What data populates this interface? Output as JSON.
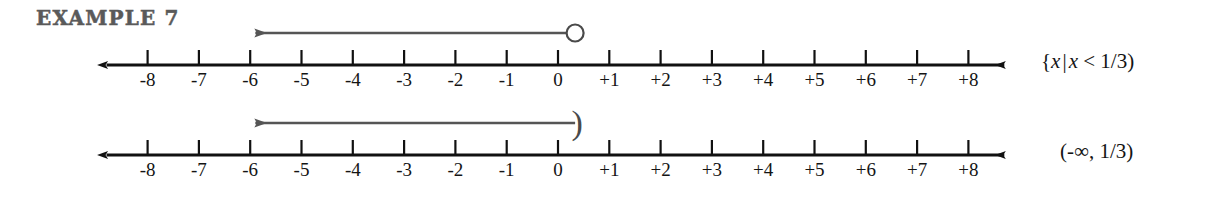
{
  "heading": {
    "label": "EXAMPLE 7"
  },
  "colors": {
    "axis": "#111111",
    "ray": "#555555",
    "marker": "#4a4a4a",
    "text": "#141414",
    "heading": "#5a5a5a",
    "background": "#ffffff"
  },
  "axis": {
    "tick_labels": [
      "-8",
      "-7",
      "-6",
      "-5",
      "-4",
      "-3",
      "-2",
      "-1",
      "0",
      "+1",
      "+2",
      "+3",
      "+4",
      "+5",
      "+6",
      "+7",
      "+8"
    ],
    "tick_values": [
      -8,
      -7,
      -6,
      -5,
      -4,
      -3,
      -2,
      -1,
      0,
      1,
      2,
      3,
      4,
      5,
      6,
      7,
      8
    ],
    "x_min": -8.8,
    "x_max": 8.7,
    "left_arrow": true,
    "right_arrow": true
  },
  "lines": [
    {
      "id": "set-builder-line",
      "notation": {
        "open_brace": "{",
        "var1": "x",
        "separator": "|",
        "var2": "x",
        "relation": "<",
        "value": "1/3",
        "close": ")",
        "full_text": "{x | x < 1/3)"
      },
      "ray": {
        "from_value": 0.3333,
        "to_value": -5.9,
        "direction": "left",
        "arrow_at": "left-end"
      },
      "endpoint": {
        "value": 0.3333,
        "type": "open-circle",
        "included": false,
        "label": "1/3"
      }
    },
    {
      "id": "interval-line",
      "notation": {
        "open": "(",
        "lower": "-∞",
        "comma": ",",
        "upper": "1/3",
        "close": ")",
        "full_text": "(-∞, 1/3)"
      },
      "ray": {
        "from_value": 0.3333,
        "to_value": -5.9,
        "direction": "left",
        "arrow_at": "left-end"
      },
      "endpoint": {
        "value": 0.3333,
        "type": "right-parenthesis",
        "included": false,
        "label": "1/3"
      }
    }
  ]
}
